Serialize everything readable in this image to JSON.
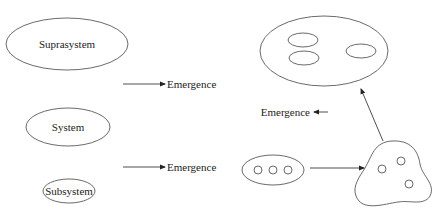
{
  "diagram": {
    "left_hierarchy": {
      "levels": [
        {
          "label": "Suprasystem"
        },
        {
          "label": "System"
        },
        {
          "label": "Subsystem"
        }
      ],
      "emergence_labels": [
        "Emergence",
        "Emergence"
      ]
    },
    "right_illustration": {
      "emergence_label": "Emergence",
      "components_circle_count": 3,
      "blob_circle_count": 3,
      "suprasystem_inner_ellipses": 3
    },
    "colors": {
      "stroke": "#333333",
      "text": "#222222",
      "background": "#ffffff"
    }
  }
}
